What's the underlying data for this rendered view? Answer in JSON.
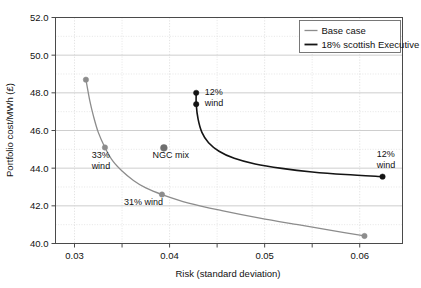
{
  "chart_data": {
    "type": "line",
    "title": "",
    "xlabel": "Risk (standard deviation)",
    "ylabel": "Portfolio cost/MWh (£)",
    "xlim": [
      0.028,
      0.0645
    ],
    "ylim": [
      40.0,
      52.0
    ],
    "grid": true,
    "legend_position": "top-right",
    "x_ticks_labeled": [
      "0.03",
      "0.04",
      "0.05",
      "0.06"
    ],
    "x_ticks_values": [
      0.03,
      0.04,
      0.05,
      0.06
    ],
    "x_minor_ticks": [
      0.035,
      0.045,
      0.055
    ],
    "y_ticks_labeled": [
      "52.0",
      "50.0",
      "48.0",
      "46.0",
      "44.0",
      "42.0",
      "40.0"
    ],
    "y_ticks_values": [
      52.0,
      50.0,
      48.0,
      46.0,
      44.0,
      42.0,
      40.0
    ],
    "y_minor_ticks": [
      51.0,
      49.0,
      47.0,
      45.0,
      43.0,
      41.0
    ],
    "series": [
      {
        "name": "Base case",
        "color": "#8c8c8c",
        "width": 1.3,
        "points": [
          {
            "x": 0.0312,
            "y": 48.7
          },
          {
            "x": 0.0316,
            "y": 47.6
          },
          {
            "x": 0.032,
            "y": 46.75
          },
          {
            "x": 0.0325,
            "y": 45.9
          },
          {
            "x": 0.0332,
            "y": 45.1
          },
          {
            "x": 0.034,
            "y": 44.4
          },
          {
            "x": 0.035,
            "y": 43.85
          },
          {
            "x": 0.0362,
            "y": 43.35
          },
          {
            "x": 0.0375,
            "y": 42.95
          },
          {
            "x": 0.0392,
            "y": 42.6
          },
          {
            "x": 0.042,
            "y": 42.15
          },
          {
            "x": 0.0455,
            "y": 41.75
          },
          {
            "x": 0.0495,
            "y": 41.35
          },
          {
            "x": 0.0535,
            "y": 41.0
          },
          {
            "x": 0.057,
            "y": 40.7
          },
          {
            "x": 0.0605,
            "y": 40.4
          }
        ],
        "markers": [
          {
            "x": 0.0312,
            "y": 48.7
          },
          {
            "x": 0.0332,
            "y": 45.1
          },
          {
            "x": 0.0392,
            "y": 42.6
          },
          {
            "x": 0.0605,
            "y": 40.4
          }
        ]
      },
      {
        "name": "18% scottish Executive",
        "color": "#141414",
        "width": 1.6,
        "points": [
          {
            "x": 0.0428,
            "y": 48.0
          },
          {
            "x": 0.0428,
            "y": 47.4
          },
          {
            "x": 0.043,
            "y": 46.6
          },
          {
            "x": 0.0434,
            "y": 45.9
          },
          {
            "x": 0.0441,
            "y": 45.35
          },
          {
            "x": 0.0452,
            "y": 44.9
          },
          {
            "x": 0.0468,
            "y": 44.52
          },
          {
            "x": 0.049,
            "y": 44.22
          },
          {
            "x": 0.0518,
            "y": 43.99
          },
          {
            "x": 0.055,
            "y": 43.8
          },
          {
            "x": 0.0585,
            "y": 43.66
          },
          {
            "x": 0.0624,
            "y": 43.55
          }
        ],
        "markers": [
          {
            "x": 0.0428,
            "y": 48.0
          },
          {
            "x": 0.0428,
            "y": 47.4
          },
          {
            "x": 0.0624,
            "y": 43.55
          }
        ]
      }
    ],
    "standalone_points": [
      {
        "label": "NGC mix",
        "x": 0.0394,
        "y": 45.08,
        "color": "#6e6e6e",
        "radius": 3.4
      }
    ],
    "annotations": [
      {
        "id": "annot-33-wind",
        "lines": [
          "33%",
          "wind"
        ],
        "x": 0.0318,
        "y": 44.55,
        "anchor": "start"
      },
      {
        "id": "annot-ngc-mix",
        "lines": [
          "NGC mix"
        ],
        "x": 0.0382,
        "y": 44.55,
        "anchor": "start"
      },
      {
        "id": "annot-31-wind",
        "lines": [
          "31% wind"
        ],
        "x": 0.0352,
        "y": 42.05,
        "anchor": "start"
      },
      {
        "id": "annot-12-wind-left",
        "lines": [
          "12%",
          "wind"
        ],
        "x": 0.0437,
        "y": 47.9,
        "anchor": "start"
      },
      {
        "id": "annot-12-wind-right",
        "lines": [
          "12%",
          "wind"
        ],
        "x": 0.0618,
        "y": 44.6,
        "anchor": "start"
      }
    ]
  },
  "legend": {
    "items": [
      {
        "label": "Base case",
        "color": "#8c8c8c",
        "width": 1.3
      },
      {
        "label": "18% scottish Executive",
        "color": "#141414",
        "width": 1.8
      }
    ]
  },
  "axes": {
    "x_title": "Risk (standard deviation)",
    "y_title": "Portfolio cost/MWh (£)"
  },
  "colors": {
    "base_case": "#8c8c8c",
    "scottish_executive": "#141414",
    "ngc_mix": "#6e6e6e",
    "grid_major": "#b9b9b9",
    "grid_minor": "#d5d5d5",
    "frame": "#4a4a4a",
    "background": "#ffffff"
  }
}
